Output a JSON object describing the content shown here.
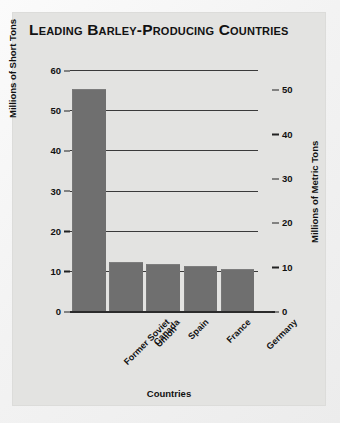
{
  "chart_data": {
    "type": "bar",
    "title": "Leading Barley-Producing Countries",
    "xlabel": "Countries",
    "ylabel": "Millions of Short Tons",
    "ylabel_secondary": "Millions of Metric Tons",
    "categories": [
      "Former Soviet Union",
      "Canada",
      "Spain",
      "France",
      "Germany"
    ],
    "values": [
      55,
      12,
      11.5,
      11,
      10.2
    ],
    "ylim": [
      0,
      60
    ],
    "yticks": [
      0,
      10,
      20,
      30,
      40,
      50,
      60
    ],
    "ylim_secondary": [
      0,
      54.4
    ],
    "yticks_secondary": [
      0,
      10,
      20,
      30,
      40,
      50
    ],
    "grid": true,
    "legend": "none",
    "bar_color": "#6f6f6f",
    "panel_color": "#e3e3e1"
  },
  "axis_left": {
    "label": "Millions of Short Tons",
    "ticks": [
      "60",
      "50",
      "40",
      "30",
      "20",
      "10",
      "0"
    ]
  },
  "axis_right": {
    "label": "Millions of Metric Tons",
    "ticks": [
      "50",
      "40",
      "30",
      "20",
      "10",
      "0"
    ]
  },
  "axis_bottom": {
    "label": "Countries",
    "categories": [
      "Former Soviet Union",
      "Canada",
      "Spain",
      "France",
      "Germany"
    ]
  }
}
